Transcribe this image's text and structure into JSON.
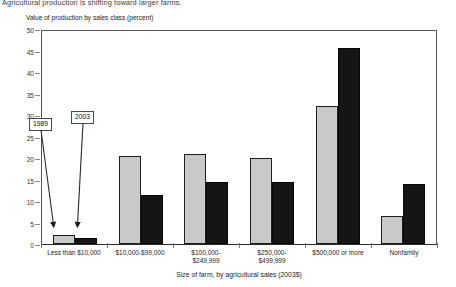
{
  "figure": {
    "title": "Agricultural production is shifting toward larger farms.",
    "y_axis_title": "Value of production by sales class (percent)",
    "x_axis_title": "Size of farm, by agricultural sales (2003$)"
  },
  "annotations": [
    {
      "label": "1989"
    },
    {
      "label": "2003"
    }
  ],
  "colors": {
    "series_1989": "#c9c9c9",
    "series_2003": "#151515",
    "axis": "#2b2b2b",
    "frame": "#555555"
  },
  "chart_data": {
    "type": "bar",
    "title": "Agricultural production is shifting toward larger farms.",
    "xlabel": "Size of farm, by agricultural sales (2003$)",
    "ylabel": "Value of production by sales class (percent)",
    "ylim": [
      0,
      50
    ],
    "yticks": [
      0,
      5,
      10,
      15,
      20,
      25,
      30,
      35,
      40,
      45,
      50
    ],
    "grid": false,
    "legend": "annotated arrows labeled 1989 and 2003 pointing at first category bars",
    "categories": [
      "Less than $10,000",
      "$10,000-$99,000",
      "$100,000-\n$249,999",
      "$250,000-\n$499,999",
      "$500,000 or more",
      "Nonfamily"
    ],
    "series": [
      {
        "name": "1989",
        "values": [
          2,
          20.5,
          21,
          20,
          32,
          6.5
        ]
      },
      {
        "name": "2003",
        "values": [
          1.5,
          11.5,
          14.5,
          14.5,
          45.5,
          14
        ]
      }
    ]
  }
}
